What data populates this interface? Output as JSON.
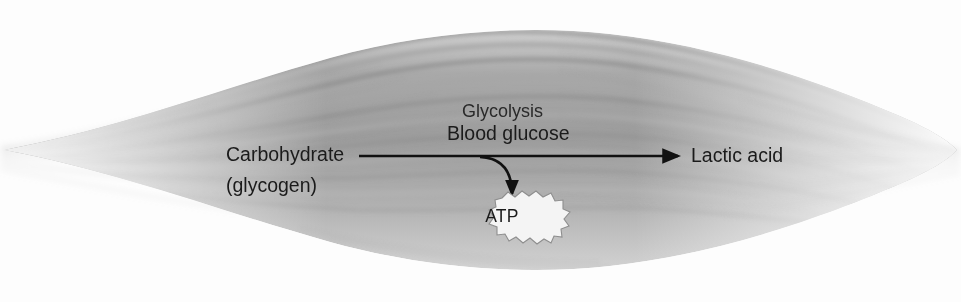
{
  "figure": {
    "background_color": "#fdfdfd",
    "ink_color": "#1b1b1b",
    "muscle_colors": {
      "fiber_dark": "#8a8a8a",
      "fiber_mid": "#b4b4b4",
      "fiber_light": "#d8d8d8",
      "striation": "#9a9a9a"
    }
  },
  "illustration": {
    "muscle_name": "striated-skeletal-muscle",
    "shape": "spindle"
  },
  "pathway": {
    "source_label": "Carbohydrate",
    "source_sublabel": "(glycogen)",
    "process_label": "Glycolysis",
    "substrate_label": "Blood glucose",
    "product_label": "Lactic acid",
    "energy_label": "ATP"
  }
}
